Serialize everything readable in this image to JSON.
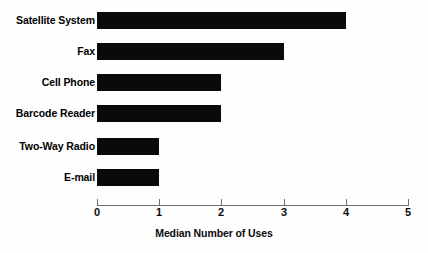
{
  "chart_data": {
    "type": "bar",
    "orientation": "horizontal",
    "title": "",
    "xlabel": "Median Number of Uses",
    "ylabel": "",
    "categories": [
      "Satellite System",
      "Fax",
      "Cell Phone",
      "Barcode Reader",
      "Two-Way Radio",
      "E-mail"
    ],
    "values": [
      4,
      3,
      2,
      2,
      1,
      1
    ],
    "xlim": [
      0,
      5
    ],
    "xticks": [
      0,
      1,
      2,
      3,
      4,
      5
    ],
    "xtick_labels": [
      "0",
      "1",
      "2",
      "3",
      "4",
      "5"
    ],
    "grid": false,
    "legend": false,
    "bar_color": "#0a0a0a",
    "background_color": "#fefefe",
    "axis_color": "#6f6f6f"
  }
}
